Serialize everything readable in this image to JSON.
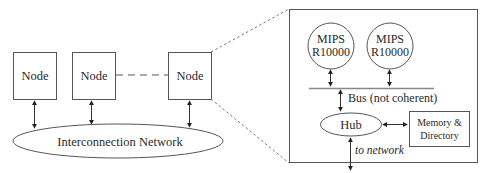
{
  "diagram": {
    "overview": {
      "nodes": [
        {
          "label": "Node"
        },
        {
          "label": "Node"
        },
        {
          "label": "Node"
        }
      ],
      "network": {
        "label": "Interconnection Network"
      }
    },
    "detail": {
      "processors": [
        {
          "line1": "MIPS",
          "line2": "R10000"
        },
        {
          "line1": "MIPS",
          "line2": "R10000"
        }
      ],
      "bus": {
        "label": "Bus (not coherent)"
      },
      "hub": {
        "label": "Hub"
      },
      "memory": {
        "line1": "Memory &",
        "line2": "Directory"
      },
      "network_link": {
        "label": "to network"
      }
    },
    "colors": {
      "stroke": "#555555",
      "text": "#2a2a2a",
      "background": "#ffffff"
    }
  }
}
